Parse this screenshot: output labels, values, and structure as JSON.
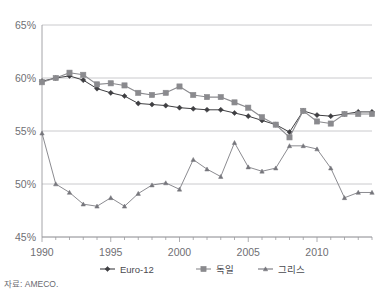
{
  "chart_data": {
    "type": "line",
    "title": "",
    "xlabel": "",
    "ylabel": "",
    "xlim": [
      1990,
      2014
    ],
    "ylim": [
      45,
      65
    ],
    "ytick_values": [
      45,
      50,
      55,
      60,
      65
    ],
    "ytick_labels": [
      "45%",
      "50%",
      "55%",
      "60%",
      "65%"
    ],
    "xtick_values": [
      1990,
      1995,
      2000,
      2005,
      2010
    ],
    "xtick_labels": [
      "1990",
      "1995",
      "2000",
      "2005",
      "2010"
    ],
    "x": [
      1990,
      1991,
      1992,
      1993,
      1994,
      1995,
      1996,
      1997,
      1998,
      1999,
      2000,
      2001,
      2002,
      2003,
      2004,
      2005,
      2006,
      2007,
      2008,
      2009,
      2010,
      2011,
      2012,
      2013,
      2014
    ],
    "grid": "horizontal",
    "legend_position": "bottom",
    "series": [
      {
        "name": "Euro-12",
        "marker": "diamond",
        "color": "#3f3f42",
        "values": [
          59.7,
          60.0,
          60.2,
          59.8,
          59.0,
          58.6,
          58.3,
          57.6,
          57.5,
          57.4,
          57.2,
          57.1,
          57.0,
          57.0,
          56.7,
          56.4,
          56.0,
          55.6,
          54.9,
          56.9,
          56.5,
          56.4,
          56.6,
          56.8,
          56.8
        ]
      },
      {
        "name": "독일",
        "marker": "square",
        "color": "#8a8a8e",
        "values": [
          59.6,
          60.0,
          60.5,
          60.3,
          59.4,
          59.5,
          59.3,
          58.6,
          58.4,
          58.6,
          59.2,
          58.4,
          58.2,
          58.2,
          57.7,
          57.2,
          56.3,
          55.6,
          54.4,
          56.9,
          55.9,
          55.7,
          56.6,
          56.6,
          56.6
        ]
      },
      {
        "name": "그리스",
        "marker": "triangle",
        "color": "#76767c",
        "values": [
          54.8,
          50.0,
          49.2,
          48.1,
          47.9,
          48.7,
          47.9,
          49.1,
          49.9,
          50.1,
          49.5,
          52.3,
          51.4,
          50.7,
          53.9,
          51.6,
          51.2,
          51.5,
          53.6,
          53.6,
          53.3,
          51.5,
          48.7,
          49.2,
          49.2
        ]
      }
    ]
  },
  "legend": {
    "items": [
      {
        "label": "Euro-12",
        "marker": "diamond",
        "color": "#3f3f42"
      },
      {
        "label": "독일",
        "marker": "square",
        "color": "#8a8a8e"
      },
      {
        "label": "그리스",
        "marker": "triangle",
        "color": "#76767c"
      }
    ]
  },
  "source": {
    "text": "자료: AMECO."
  },
  "colors": {
    "axis": "#9a9a9e",
    "grid": "#bcbcc0",
    "text": "#6f6f74",
    "plot_background": "#ffffff"
  }
}
